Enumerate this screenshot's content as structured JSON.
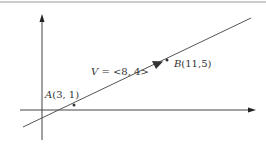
{
  "diagram": {
    "type": "vector-on-line",
    "point_a": {
      "name": "A",
      "coords": "(3, 1)",
      "x": 3,
      "y": 1
    },
    "point_b": {
      "name": "B",
      "coords": "(11,5)",
      "x": 11,
      "y": 5
    },
    "vector": {
      "name": "V",
      "label_rest": " = <8, 4>",
      "components": [
        8,
        4
      ]
    },
    "colors": {
      "line": "#555555",
      "axis": "#444444",
      "text": "#333333",
      "border": "#999999"
    }
  }
}
